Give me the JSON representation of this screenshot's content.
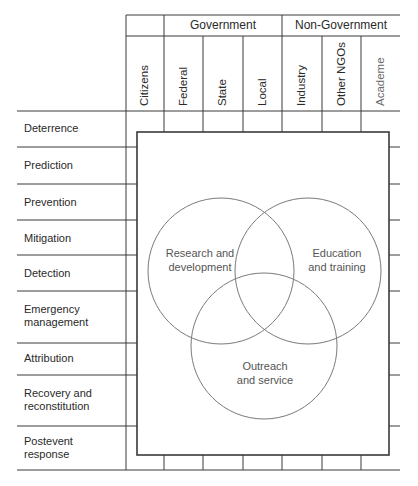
{
  "header": {
    "groups": [
      {
        "label": "Government"
      },
      {
        "label": "Non-Government"
      }
    ],
    "columns": [
      {
        "label": "Citizens"
      },
      {
        "label": "Federal"
      },
      {
        "label": "State"
      },
      {
        "label": "Local"
      },
      {
        "label": "Industry"
      },
      {
        "label": "Other NGOs"
      },
      {
        "label": "Academe"
      }
    ]
  },
  "rows": [
    {
      "label": "Deterrence"
    },
    {
      "label": "Prediction"
    },
    {
      "label": "Prevention"
    },
    {
      "label": "Mitigation"
    },
    {
      "label": "Detection"
    },
    {
      "label": "Emergency\nmanagement",
      "line1": "Emergency",
      "line2": "management"
    },
    {
      "label": "Attribution"
    },
    {
      "label": "Recovery and\nreconstitution",
      "line1": "Recovery and",
      "line2": "reconstitution"
    },
    {
      "label": "Postevent\nresponse",
      "line1": "Postevent",
      "line2": "response"
    }
  ],
  "venn": {
    "circles": [
      {
        "line1": "Research and",
        "line2": "development"
      },
      {
        "line1": "Education",
        "line2": "and training"
      },
      {
        "line1": "Outreach",
        "line2": "and service"
      }
    ]
  },
  "colors": {
    "line": "#3a3a3a",
    "circle": "#7a7a7a",
    "text": "#2a2a2a"
  }
}
